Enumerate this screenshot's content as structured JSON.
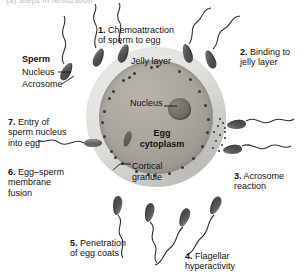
{
  "figure": {
    "clipped_title": "(a) Steps in fertilization",
    "egg": {
      "jelly_layer_label": "Jelly layer",
      "nucleus_label": "Nucleus",
      "cytoplasm_label": "Egg\ncytoplasm",
      "cortical_granule_label": "Cortical\ngranule"
    },
    "sperm_key": {
      "title": "Sperm",
      "parts": [
        "Nucleus",
        "Acrosome"
      ]
    },
    "steps": [
      {
        "num": "1.",
        "text": " Chemoattraction\nof sperm to egg"
      },
      {
        "num": "2.",
        "text": " Binding to\njelly layer"
      },
      {
        "num": "3.",
        "text": " Acrosome\nreaction"
      },
      {
        "num": "4.",
        "text": " Flagellar\nhyperactivity"
      },
      {
        "num": "5.",
        "text": " Penetration\nof egg coats"
      },
      {
        "num": "6.",
        "text": " Egg–sperm\nmembrane\nfusion"
      },
      {
        "num": "7.",
        "text": " Entry of\nsperm nucleus\ninto egg"
      }
    ],
    "colors": {
      "jelly": "#dcdcda",
      "cytoplasm": "#a8a49c",
      "nucleus": "#6a6660",
      "granule": "#3b3936",
      "sperm_head": "#5a5a58",
      "text": "#111111"
    }
  }
}
